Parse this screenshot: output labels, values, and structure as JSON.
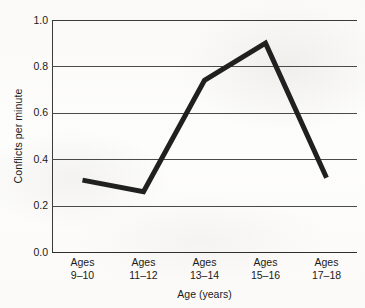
{
  "chart_data": {
    "type": "line",
    "title": "",
    "categories": [
      "Ages 9–10",
      "Ages 11–12",
      "Ages 13–14",
      "Ages 15–16",
      "Ages 17–18"
    ],
    "category_lines": [
      [
        "Ages",
        "9–10"
      ],
      [
        "Ages",
        "11–12"
      ],
      [
        "Ages",
        "13–14"
      ],
      [
        "Ages",
        "15–16"
      ],
      [
        "Ages",
        "17–18"
      ]
    ],
    "values": [
      0.31,
      0.26,
      0.74,
      0.9,
      0.32
    ],
    "xlabel": "Age (years)",
    "ylabel": "Conflicts per minute",
    "ylim": [
      0.0,
      1.0
    ],
    "yticks": [
      1.0,
      0.8,
      0.6,
      0.4,
      0.2,
      0.0
    ],
    "ytick_labels": [
      "1.0",
      "0.8",
      "0.6",
      "0.4",
      "0.2",
      "0.0"
    ],
    "grid": "horizontal",
    "legend": "none",
    "line_color": "#202020",
    "line_width": 5,
    "markers": "none",
    "background_color": "#fdfdfc",
    "axis_color": "#3a3a3a",
    "gridline_color": "#4a4a4a"
  }
}
